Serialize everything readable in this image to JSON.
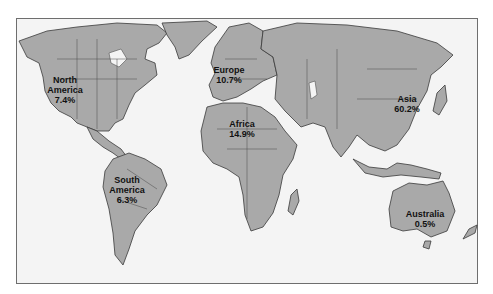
{
  "map": {
    "type": "world map",
    "regions": [
      {
        "id": "north-america",
        "name_lines": [
          "North",
          "America"
        ],
        "value": "7.4%"
      },
      {
        "id": "south-america",
        "name_lines": [
          "South",
          "America"
        ],
        "value": "6.3%"
      },
      {
        "id": "europe",
        "name_lines": [
          "Europe"
        ],
        "value": "10.7%"
      },
      {
        "id": "africa",
        "name_lines": [
          "Africa"
        ],
        "value": "14.9%"
      },
      {
        "id": "asia",
        "name_lines": [
          "Asia"
        ],
        "value": "60.2%"
      },
      {
        "id": "australia",
        "name_lines": [
          "Australia"
        ],
        "value": "0.5%"
      }
    ],
    "colors": {
      "land": "#a9a9a9",
      "ocean": "#f4f4f4",
      "border": "#3a3a3a"
    }
  }
}
